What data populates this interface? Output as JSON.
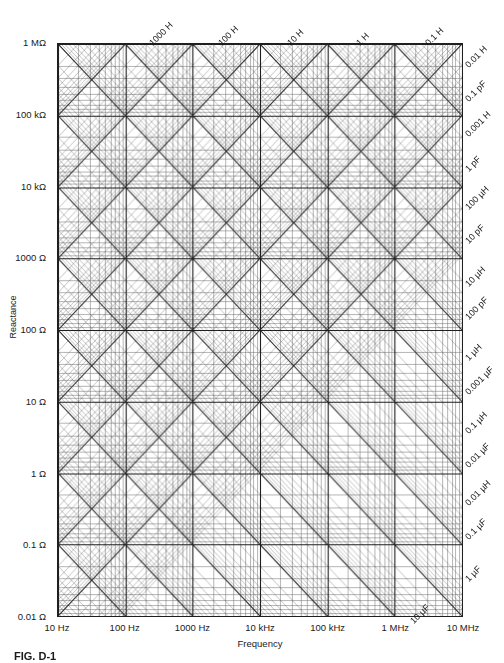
{
  "figure": {
    "caption": "FIG. D-1"
  },
  "axes": {
    "x_title": "Frequency",
    "y_title": "Reactance"
  },
  "chart_data": {
    "type": "line",
    "title": "",
    "subtitle": "",
    "xlabel": "Frequency",
    "ylabel": "Reactance",
    "grid": true,
    "legend_position": "none",
    "scale": "log-log",
    "xlim": [
      10,
      10000000
    ],
    "ylim": [
      0.01,
      1000000
    ],
    "x_tick_labels": [
      "10 Hz",
      "100 Hz",
      "1000 Hz",
      "10 kHz",
      "100 kHz",
      "1 MHz",
      "10 MHz"
    ],
    "x_tick_values": [
      10,
      100,
      1000,
      10000,
      100000,
      1000000,
      10000000
    ],
    "y_tick_labels": [
      "1 MΩ",
      "100 kΩ",
      "10 kΩ",
      "1000 Ω",
      "100 Ω",
      "10 Ω",
      "1 Ω",
      "0.1 Ω",
      "0.01 Ω"
    ],
    "y_tick_values": [
      1000000,
      100000,
      10000,
      1000,
      100,
      10,
      1,
      0.1,
      0.01
    ],
    "inductance_lines_top": [
      {
        "label": "1000 H",
        "x_frac": 0.232,
        "y_px": 40
      },
      {
        "label": "100 H",
        "x_frac": 0.402,
        "y_px": 40
      },
      {
        "label": "10 H",
        "x_frac": 0.572,
        "y_px": 40
      },
      {
        "label": "1 H",
        "x_frac": 0.742,
        "y_px": 40
      },
      {
        "label": "0.1 H",
        "x_frac": 0.912,
        "y_px": 40
      }
    ],
    "right_edge_labels": [
      {
        "label": "0.01 H",
        "y_px": 62
      },
      {
        "label": "0.1 pF",
        "y_px": 96
      },
      {
        "label": "0.001 H",
        "y_px": 131
      },
      {
        "label": "1 pF",
        "y_px": 166
      },
      {
        "label": "100 µH",
        "y_px": 204
      },
      {
        "label": "10 pF",
        "y_px": 238
      },
      {
        "label": "10 µH",
        "y_px": 281
      },
      {
        "label": "100 pF",
        "y_px": 314
      },
      {
        "label": "1 µH",
        "y_px": 355
      },
      {
        "label": "0.001 µF",
        "y_px": 389
      },
      {
        "label": "0.1 µH",
        "y_px": 428
      },
      {
        "label": "0.01 µF",
        "y_px": 462
      },
      {
        "label": "0.01 µH",
        "y_px": 500
      },
      {
        "label": "0.1 µF",
        "y_px": 534
      },
      {
        "label": "1 µF",
        "y_px": 576
      }
    ],
    "corner_labels": [
      {
        "label": "10 µF",
        "x_px": 412,
        "y_px": 618
      }
    ],
    "inductance_decades": [
      "1000 H",
      "100 H",
      "10 H",
      "1 H",
      "0.1 H",
      "0.01 H",
      "0.001 H",
      "100 µH",
      "10 µH",
      "1 µH",
      "0.1 µH",
      "0.01 µH"
    ],
    "capacitance_decades": [
      "0.1 pF",
      "1 pF",
      "10 pF",
      "100 pF",
      "0.001 µF",
      "0.01 µF",
      "0.1 µF",
      "1 µF",
      "10 µF"
    ],
    "colors": {
      "grid_major": "#1f1f1f",
      "grid_minor": "#6a6a6a",
      "diagonal": "#2a2a2a",
      "frame": "#1f1f1f",
      "background": "#ffffff"
    }
  }
}
